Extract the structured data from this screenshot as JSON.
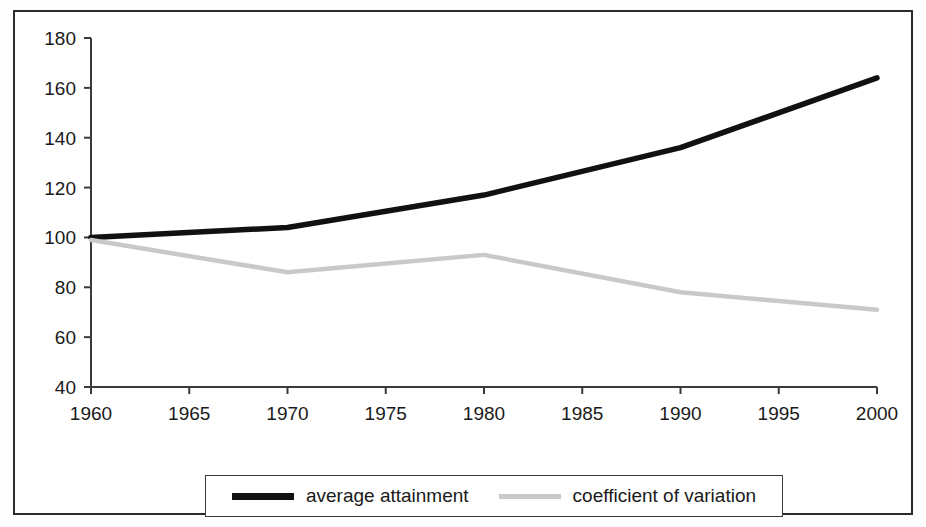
{
  "chart_data": {
    "type": "line",
    "title": "",
    "subtitle": "",
    "xlabel": "",
    "ylabel": "",
    "x": [
      1960,
      1970,
      1980,
      1990,
      2000
    ],
    "xlim": [
      1960,
      2000
    ],
    "ylim": [
      40,
      180
    ],
    "grid": false,
    "legend_position": "bottom",
    "x_tick_labels": [
      "1960",
      "1965",
      "1970",
      "1975",
      "1980",
      "1985",
      "1990",
      "1995",
      "2000"
    ],
    "x_ticks": [
      1960,
      1965,
      1970,
      1975,
      1980,
      1985,
      1990,
      1995,
      2000
    ],
    "y_tick_labels": [
      "180",
      "160",
      "140",
      "120",
      "100",
      "80",
      "60",
      "40"
    ],
    "y_ticks": [
      180,
      160,
      140,
      120,
      100,
      80,
      60,
      40
    ],
    "series": [
      {
        "name": "average attainment",
        "color": "#111111",
        "values": [
          100,
          104,
          117,
          136,
          164
        ]
      },
      {
        "name": "coefficient of variation",
        "color": "#c9c9c9",
        "values": [
          99,
          86,
          93,
          78,
          71
        ]
      }
    ]
  },
  "legend": {
    "entries": [
      {
        "label": "average attainment",
        "swatch": "series-black"
      },
      {
        "label": "coefficient of variation",
        "swatch": "series-gray"
      }
    ]
  },
  "colors": {
    "frame": "#2b2b2b",
    "axis": "#3a3a3a",
    "series_1": "#111111",
    "series_2": "#c9c9c9",
    "background": "#ffffff"
  }
}
